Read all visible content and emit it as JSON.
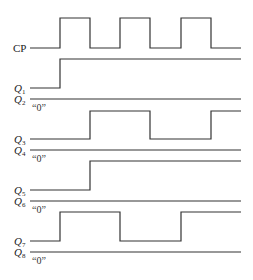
{
  "diagram": {
    "type": "timing-diagram",
    "line_color": "#333333",
    "x_start": 30,
    "x_end": 241,
    "edges_x": [
      60,
      90,
      120,
      150,
      181,
      211
    ],
    "signals": [
      {
        "id": "CP",
        "label": "CP",
        "sub": "",
        "high_y": 18,
        "low_y": 48,
        "start": 0,
        "toggles": [
          60,
          90,
          120,
          150,
          181,
          211
        ],
        "label_y": 52,
        "note": ""
      },
      {
        "id": "Q1",
        "label": "Q",
        "sub": "1",
        "high_y": 59,
        "low_y": 88,
        "start": 0,
        "toggles": [
          60
        ],
        "label_y": 92,
        "note": ""
      },
      {
        "id": "Q2",
        "label": "Q",
        "sub": "2",
        "high_y": 70,
        "low_y": 99,
        "start": 0,
        "toggles": [],
        "label_y": 103,
        "note": "“0”"
      },
      {
        "id": "Q3",
        "label": "Q",
        "sub": "3",
        "high_y": 111,
        "low_y": 139,
        "start": 0,
        "toggles": [
          90,
          150,
          211
        ],
        "label_y": 143,
        "note": ""
      },
      {
        "id": "Q4",
        "label": "Q",
        "sub": "4",
        "high_y": 122,
        "low_y": 150,
        "start": 0,
        "toggles": [],
        "label_y": 154,
        "note": "“0”"
      },
      {
        "id": "Q5",
        "label": "Q",
        "sub": "5",
        "high_y": 161,
        "low_y": 190,
        "start": 0,
        "toggles": [
          90
        ],
        "label_y": 194,
        "note": ""
      },
      {
        "id": "Q6",
        "label": "Q",
        "sub": "6",
        "high_y": 172,
        "low_y": 201,
        "start": 0,
        "toggles": [],
        "label_y": 205,
        "note": "“0”"
      },
      {
        "id": "Q7",
        "label": "Q",
        "sub": "7",
        "high_y": 212,
        "low_y": 241,
        "start": 0,
        "toggles": [
          60,
          120,
          181
        ],
        "label_y": 245,
        "note": ""
      },
      {
        "id": "Q8",
        "label": "Q",
        "sub": "8",
        "high_y": 223,
        "low_y": 252,
        "start": 0,
        "toggles": [],
        "label_y": 256,
        "note": "“0”"
      }
    ]
  }
}
